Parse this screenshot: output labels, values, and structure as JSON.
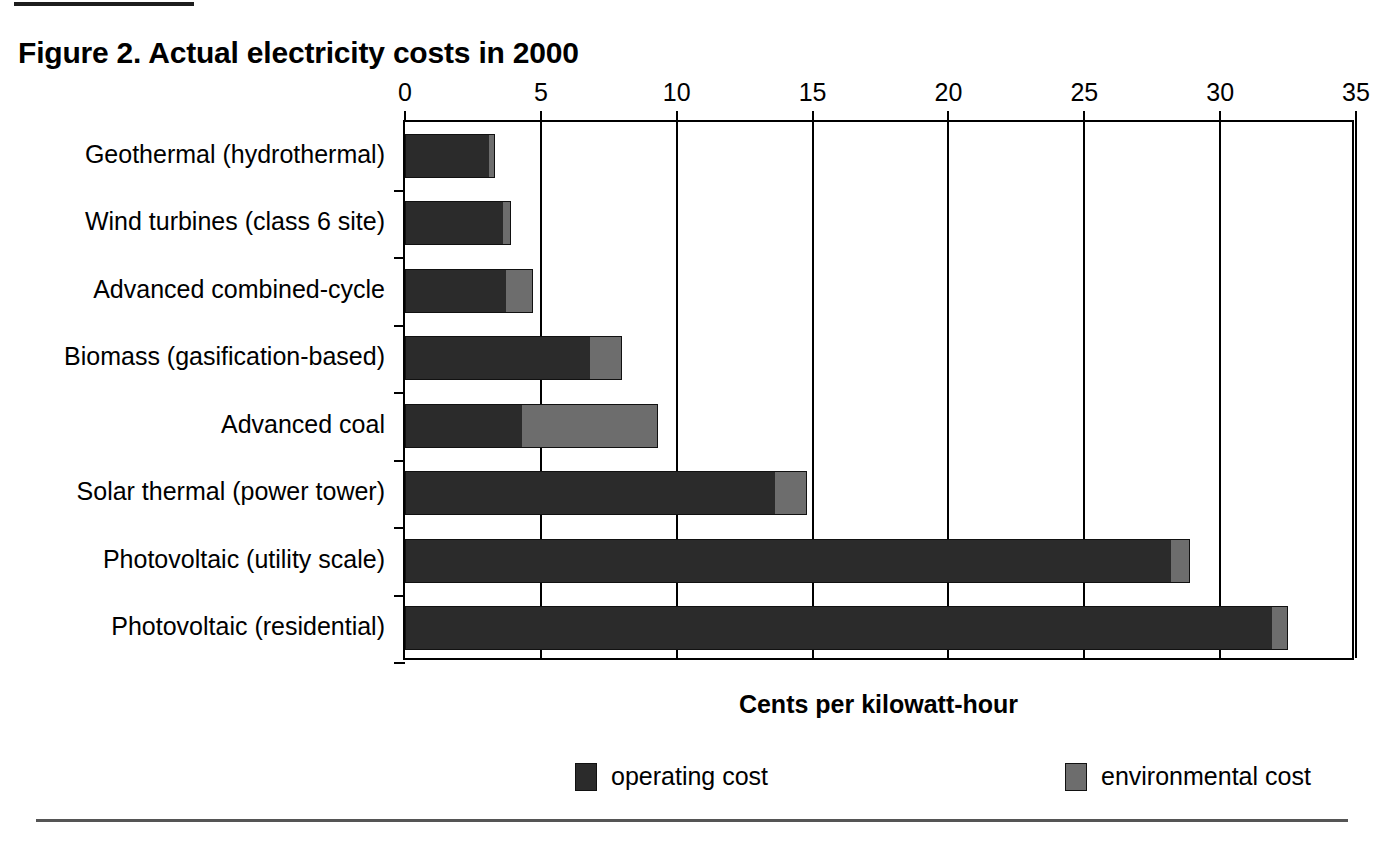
{
  "figure": {
    "title": "Figure 2. Actual electricity costs in 2000"
  },
  "chart_data": {
    "type": "bar",
    "orientation": "horizontal",
    "stacked": true,
    "title": "Figure 2. Actual electricity costs in 2000",
    "xlabel": "Cents per kilowatt-hour",
    "ylabel": "",
    "xlim": [
      0,
      35
    ],
    "xticks": [
      0,
      5,
      10,
      15,
      20,
      25,
      30,
      35
    ],
    "xtick_labels": [
      "0",
      "5",
      "10",
      "15",
      "20",
      "25",
      "30",
      "35"
    ],
    "grid": true,
    "legend_position": "bottom",
    "categories": [
      "Geothermal (hydrothermal)",
      "Wind turbines (class 6 site)",
      "Advanced combined-cycle",
      "Biomass (gasification-based)",
      "Advanced coal",
      "Solar thermal (power tower)",
      "Photovoltaic (utility scale)",
      "Photovoltaic (residential)"
    ],
    "series": [
      {
        "name": "operating cost",
        "color": "#2b2b2b",
        "values": [
          3.1,
          3.6,
          3.7,
          6.8,
          4.3,
          13.6,
          28.2,
          31.9
        ]
      },
      {
        "name": "environmental cost",
        "color": "#6d6d6d",
        "values": [
          0.2,
          0.3,
          1.0,
          1.2,
          5.0,
          1.2,
          0.7,
          0.6
        ]
      }
    ],
    "totals": [
      3.3,
      3.9,
      4.7,
      8.0,
      9.3,
      14.8,
      28.9,
      32.5
    ]
  },
  "axis": {
    "x_title": "Cents per kilowatt-hour",
    "ticks": [
      "0",
      "5",
      "10",
      "15",
      "20",
      "25",
      "30",
      "35"
    ]
  },
  "legend": {
    "items": [
      {
        "label": "operating cost",
        "color": "#2b2b2b"
      },
      {
        "label": "environmental cost",
        "color": "#6d6d6d"
      }
    ]
  }
}
